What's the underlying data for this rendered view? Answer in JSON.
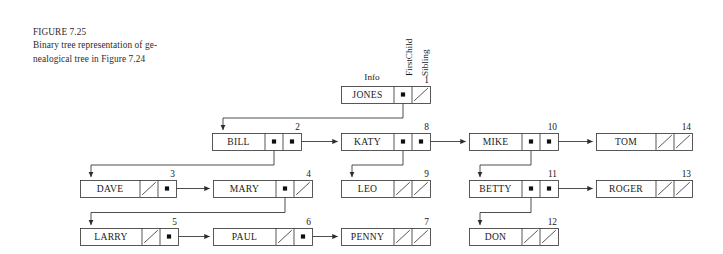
{
  "figure": {
    "label": "FIGURE 7.25",
    "caption_line1": "Binary tree representation of ge-",
    "caption_line2": "nealogical tree in Figure 7.24"
  },
  "field_headers": {
    "info": "Info",
    "firstchild": "FirstChild",
    "sibling": "Sibling"
  },
  "colors": {
    "ink": "#1a1a1a",
    "stroke": "#3a3a3a",
    "background": "#ffffff",
    "pointer_dot": "#101010"
  },
  "diagram": {
    "type": "binary-tree-linked-representation",
    "nodes": [
      {
        "id": 1,
        "index": "1",
        "name": "JONES",
        "firstchild": "pointer",
        "sibling": "null",
        "x": 341,
        "y": 86,
        "w": 89,
        "info_w": 53
      },
      {
        "id": 2,
        "index": "2",
        "name": "BILL",
        "firstchild": "pointer",
        "sibling": "pointer",
        "x": 212,
        "y": 133,
        "w": 89,
        "info_w": 53
      },
      {
        "id": 8,
        "index": "8",
        "name": "KATY",
        "firstchild": "pointer",
        "sibling": "pointer",
        "x": 341,
        "y": 133,
        "w": 89,
        "info_w": 53
      },
      {
        "id": 10,
        "index": "10",
        "name": "MIKE",
        "firstchild": "pointer",
        "sibling": "pointer",
        "x": 469,
        "y": 133,
        "w": 89,
        "info_w": 53
      },
      {
        "id": 14,
        "index": "14",
        "name": "TOM",
        "firstchild": "null",
        "sibling": "null",
        "x": 596,
        "y": 133,
        "w": 96,
        "info_w": 60
      },
      {
        "id": 3,
        "index": "3",
        "name": "DAVE",
        "firstchild": "null",
        "sibling": "pointer",
        "x": 80,
        "y": 180,
        "w": 96,
        "info_w": 60
      },
      {
        "id": 4,
        "index": "4",
        "name": "MARY",
        "firstchild": "pointer",
        "sibling": "null",
        "x": 213,
        "y": 180,
        "w": 99,
        "info_w": 63
      },
      {
        "id": 9,
        "index": "9",
        "name": "LEO",
        "firstchild": "null",
        "sibling": "null",
        "x": 341,
        "y": 180,
        "w": 89,
        "info_w": 53
      },
      {
        "id": 11,
        "index": "11",
        "name": "BETTY",
        "firstchild": "pointer",
        "sibling": "pointer",
        "x": 469,
        "y": 180,
        "w": 89,
        "info_w": 53
      },
      {
        "id": 13,
        "index": "13",
        "name": "ROGER",
        "firstchild": "null",
        "sibling": "null",
        "x": 596,
        "y": 180,
        "w": 96,
        "info_w": 60
      },
      {
        "id": 5,
        "index": "5",
        "name": "LARRY",
        "firstchild": "null",
        "sibling": "pointer",
        "x": 80,
        "y": 228,
        "w": 98,
        "info_w": 62
      },
      {
        "id": 6,
        "index": "6",
        "name": "PAUL",
        "firstchild": "null",
        "sibling": "pointer",
        "x": 213,
        "y": 228,
        "w": 99,
        "info_w": 63
      },
      {
        "id": 7,
        "index": "7",
        "name": "PENNY",
        "firstchild": "null",
        "sibling": "null",
        "x": 341,
        "y": 228,
        "w": 89,
        "info_w": 53
      },
      {
        "id": 12,
        "index": "12",
        "name": "DON",
        "firstchild": "null",
        "sibling": "null",
        "x": 469,
        "y": 228,
        "w": 89,
        "info_w": 53
      }
    ],
    "edges": [
      {
        "from": "JONES.firstchild",
        "to": "BILL",
        "kind": "down-left-elbow"
      },
      {
        "from": "BILL.sibling",
        "to": "KATY",
        "kind": "right-arrow"
      },
      {
        "from": "KATY.sibling",
        "to": "MIKE",
        "kind": "right-arrow"
      },
      {
        "from": "MIKE.sibling",
        "to": "TOM",
        "kind": "right-arrow"
      },
      {
        "from": "BILL.firstchild",
        "to": "DAVE",
        "kind": "down-left-elbow"
      },
      {
        "from": "DAVE.sibling",
        "to": "MARY",
        "kind": "right-arrow"
      },
      {
        "from": "MARY.firstchild",
        "to": "LARRY",
        "kind": "down-left-elbow"
      },
      {
        "from": "LARRY.sibling",
        "to": "PAUL",
        "kind": "right-arrow"
      },
      {
        "from": "PAUL.sibling",
        "to": "PENNY",
        "kind": "right-arrow"
      },
      {
        "from": "KATY.firstchild",
        "to": "LEO",
        "kind": "down-left-elbow"
      },
      {
        "from": "MIKE.firstchild",
        "to": "BETTY",
        "kind": "down-left-elbow"
      },
      {
        "from": "BETTY.sibling",
        "to": "ROGER",
        "kind": "right-arrow"
      },
      {
        "from": "BETTY.firstchild",
        "to": "DON",
        "kind": "down-left-elbow"
      }
    ]
  }
}
